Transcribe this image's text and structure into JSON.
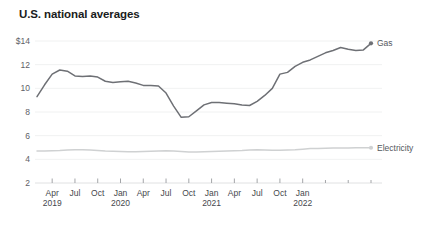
{
  "chart_data": {
    "type": "line",
    "title": "U.S. national averages",
    "xlabel": "",
    "ylabel": "",
    "ylim": [
      2,
      14
    ],
    "yticks": [
      2,
      4,
      6,
      8,
      10,
      12,
      14
    ],
    "ytick_labels": [
      "2",
      "4",
      "6",
      "8",
      "10",
      "12",
      "$14"
    ],
    "grid": true,
    "legend_position": "right-inline",
    "x": [
      "Feb 2019",
      "Mar 2019",
      "Apr 2019",
      "May 2019",
      "Jun 2019",
      "Jul 2019",
      "Aug 2019",
      "Sep 2019",
      "Oct 2019",
      "Nov 2019",
      "Dec 2019",
      "Jan 2020",
      "Feb 2020",
      "Mar 2020",
      "Apr 2020",
      "May 2020",
      "Jun 2020",
      "Jul 2020",
      "Aug 2020",
      "Sep 2020",
      "Oct 2020",
      "Nov 2020",
      "Dec 2020",
      "Jan 2021",
      "Feb 2021",
      "Mar 2021",
      "Apr 2021",
      "May 2021",
      "Jun 2021",
      "Jul 2021",
      "Aug 2021",
      "Sep 2021",
      "Oct 2021",
      "Nov 2021",
      "Dec 2021",
      "Jan 2022",
      "Feb 2022"
    ],
    "xtick_labels": [
      {
        "month": "Apr",
        "year": "2019"
      },
      {
        "month": "Jul",
        "year": ""
      },
      {
        "month": "Oct",
        "year": ""
      },
      {
        "month": "Jan",
        "year": "2020"
      },
      {
        "month": "Apr",
        "year": ""
      },
      {
        "month": "Jul",
        "year": ""
      },
      {
        "month": "Oct",
        "year": ""
      },
      {
        "month": "Jan",
        "year": "2021"
      },
      {
        "month": "Apr",
        "year": ""
      },
      {
        "month": "Jul",
        "year": ""
      },
      {
        "month": "Oct",
        "year": ""
      },
      {
        "month": "Jan",
        "year": "2022"
      }
    ],
    "series": [
      {
        "name": "Gas",
        "color": "#6e7075",
        "end_label": "Gas",
        "values": [
          9.3,
          10.3,
          11.2,
          11.55,
          11.45,
          11.05,
          11.0,
          11.05,
          10.95,
          10.6,
          10.5,
          10.55,
          10.6,
          10.45,
          10.25,
          10.25,
          10.2,
          9.6,
          8.5,
          7.55,
          7.6,
          8.1,
          8.6,
          8.8,
          8.8,
          8.75,
          8.7,
          8.6,
          8.55,
          8.9,
          9.4,
          10.0,
          11.2,
          11.35,
          11.85,
          12.2,
          12.4
        ]
      },
      {
        "name": "Electricity",
        "color": "#cfd1d2",
        "end_label": "Electricity",
        "values": [
          4.7,
          4.7,
          4.72,
          4.74,
          4.78,
          4.82,
          4.8,
          4.78,
          4.74,
          4.7,
          4.68,
          4.66,
          4.65,
          4.64,
          4.66,
          4.68,
          4.7,
          4.72,
          4.7,
          4.66,
          4.62,
          4.62,
          4.64,
          4.66,
          4.68,
          4.7,
          4.72,
          4.74,
          4.78,
          4.8,
          4.78,
          4.76,
          4.76,
          4.78,
          4.8,
          4.86,
          4.92
        ]
      }
    ],
    "gas_tail": [
      12.7,
      13.0,
      13.2,
      13.45,
      13.3,
      13.2,
      13.25,
      13.8
    ],
    "elec_tail": [
      4.92,
      4.94,
      4.95,
      4.96,
      4.96,
      4.97,
      4.98,
      4.98
    ]
  }
}
